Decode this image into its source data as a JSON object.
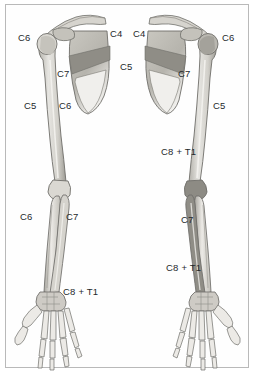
{
  "figure": {
    "view": "posterior",
    "border_color": "#b9b9b9",
    "background_color": "#ffffff",
    "label_color": "#25282b"
  },
  "palette": {
    "bone_light": "#e8e7e3",
    "bone_mid": "#cfcdc7",
    "bone_shadow": "#a8a69f",
    "bone_outline": "#6f6e6a",
    "shade_dark": "#8f8d86",
    "shade_darker": "#7c7a73",
    "scapula_fill": "#bdbbb4",
    "highlight": "#f4f3f0"
  },
  "labels": {
    "left_limb": [
      {
        "id": "left-c6-shoulder",
        "text": "C6",
        "x": 18,
        "y": 33
      },
      {
        "id": "left-c7-scapula",
        "text": "C7",
        "x": 57,
        "y": 69
      },
      {
        "id": "left-c5-humerus",
        "text": "C5",
        "x": 24,
        "y": 101
      },
      {
        "id": "left-c6-humerus",
        "text": "C6",
        "x": 59,
        "y": 101
      },
      {
        "id": "left-c6-forearm",
        "text": "C6",
        "x": 20,
        "y": 212
      },
      {
        "id": "left-c7-forearm",
        "text": "C7",
        "x": 66,
        "y": 212
      },
      {
        "id": "left-c8t1-hand",
        "text": "C8 + T1",
        "x": 63,
        "y": 287
      }
    ],
    "center": [
      {
        "id": "center-c4-left",
        "text": "C4",
        "x": 110,
        "y": 29
      },
      {
        "id": "center-c4-right",
        "text": "C4",
        "x": 133,
        "y": 29
      },
      {
        "id": "center-c5",
        "text": "C5",
        "x": 120,
        "y": 62
      }
    ],
    "right_limb": [
      {
        "id": "right-c6-shoulder",
        "text": "C6",
        "x": 222,
        "y": 33
      },
      {
        "id": "right-c7-scapula",
        "text": "C7",
        "x": 178,
        "y": 69
      },
      {
        "id": "right-c5-humerus",
        "text": "C5",
        "x": 213,
        "y": 101
      },
      {
        "id": "right-c8t1-humerus",
        "text": "C8 + T1",
        "x": 161,
        "y": 147
      },
      {
        "id": "right-c7-forearm",
        "text": "C7",
        "x": 181,
        "y": 215
      },
      {
        "id": "right-c8t1-forearm",
        "text": "C8 + T1",
        "x": 166,
        "y": 263
      }
    ]
  }
}
